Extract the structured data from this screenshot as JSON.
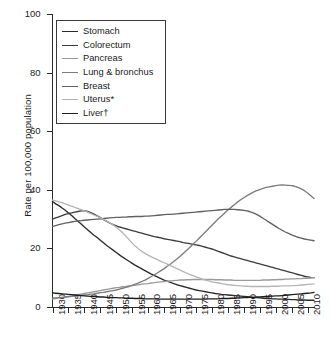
{
  "chart_data": {
    "type": "line",
    "title": "",
    "xlabel": "",
    "ylabel": "Rate per 100,000 population",
    "xlim": [
      1930,
      2012
    ],
    "ylim": [
      0,
      100
    ],
    "xticks": [
      1930,
      1935,
      1940,
      1945,
      1950,
      1955,
      1960,
      1965,
      1970,
      1975,
      1980,
      1985,
      1990,
      1995,
      2000,
      2005,
      2010
    ],
    "yticks": [
      0,
      20,
      40,
      60,
      80,
      100
    ],
    "grid": false,
    "legend_position": "top-left",
    "x_start": 1930,
    "x_step": 1,
    "series": [
      {
        "name": "Stomach",
        "color": "#2b2b2b",
        "values": [
          36.0,
          35.2,
          34.6,
          33.8,
          33.0,
          32.1,
          31.2,
          30.2,
          29.3,
          28.3,
          27.3,
          26.4,
          25.4,
          24.5,
          23.7,
          22.8,
          21.9,
          21.0,
          20.2,
          19.4,
          18.6,
          17.8,
          17.0,
          16.3,
          15.6,
          14.9,
          14.2,
          13.6,
          13.0,
          12.4,
          11.8,
          11.2,
          10.7,
          10.2,
          9.7,
          9.2,
          8.8,
          8.4,
          8.0,
          7.6,
          7.3,
          7.0,
          6.7,
          6.4,
          6.1,
          5.8,
          5.6,
          5.4,
          5.2,
          5.0,
          4.8,
          4.6,
          4.5,
          4.3,
          4.2,
          4.1,
          4.0,
          3.9,
          3.8,
          3.7,
          3.6,
          3.5,
          3.4,
          3.3,
          3.2,
          3.1,
          3.0,
          2.9,
          2.9,
          2.8,
          2.8,
          2.7,
          2.7,
          2.6,
          2.6,
          2.5,
          2.5,
          2.4,
          2.4,
          2.4,
          2.3,
          2.3,
          2.3
        ]
      },
      {
        "name": "Colorectum",
        "color": "#3c3c3c",
        "values": [
          30.0,
          30.4,
          30.8,
          31.2,
          31.6,
          31.9,
          32.1,
          32.4,
          32.6,
          32.8,
          32.9,
          32.6,
          32.2,
          31.7,
          31.1,
          30.5,
          29.8,
          29.2,
          28.6,
          28.1,
          27.7,
          27.3,
          27.0,
          26.7,
          26.4,
          26.1,
          25.8,
          25.5,
          25.2,
          24.9,
          24.6,
          24.3,
          24.0,
          23.8,
          23.6,
          23.3,
          23.1,
          22.9,
          22.7,
          22.5,
          22.3,
          22.0,
          21.8,
          21.6,
          21.4,
          21.2,
          21.0,
          20.7,
          20.4,
          20.1,
          19.8,
          19.4,
          19.0,
          18.6,
          18.2,
          17.8,
          17.4,
          17.1,
          16.8,
          16.5,
          16.2,
          15.9,
          15.6,
          15.3,
          15.0,
          14.7,
          14.4,
          14.1,
          13.8,
          13.5,
          13.2,
          12.9,
          12.6,
          12.3,
          12.0,
          11.7,
          11.4,
          11.1,
          10.8,
          10.5,
          10.3,
          10.1,
          10.0
        ]
      },
      {
        "name": "Pancreas",
        "color": "#9a9a9a",
        "values": [
          2.8,
          2.9,
          3.1,
          3.2,
          3.4,
          3.6,
          3.8,
          4.0,
          4.2,
          4.4,
          4.6,
          4.8,
          5.0,
          5.2,
          5.4,
          5.6,
          5.8,
          6.0,
          6.2,
          6.4,
          6.6,
          6.7,
          6.9,
          7.0,
          7.2,
          7.3,
          7.5,
          7.6,
          7.8,
          7.9,
          8.0,
          8.2,
          8.3,
          8.5,
          8.6,
          8.7,
          8.8,
          8.9,
          9.0,
          9.1,
          9.2,
          9.2,
          9.3,
          9.3,
          9.4,
          9.4,
          9.4,
          9.4,
          9.4,
          9.4,
          9.4,
          9.3,
          9.3,
          9.3,
          9.2,
          9.2,
          9.2,
          9.1,
          9.1,
          9.1,
          9.1,
          9.1,
          9.1,
          9.1,
          9.1,
          9.1,
          9.2,
          9.2,
          9.2,
          9.3,
          9.3,
          9.4,
          9.4,
          9.5,
          9.5,
          9.6,
          9.6,
          9.7,
          9.7,
          9.8,
          9.8,
          9.9,
          10.0
        ]
      },
      {
        "name": "Lung & bronchus",
        "color": "#7c7c7c",
        "values": [
          3.0,
          3.1,
          3.2,
          3.3,
          3.4,
          3.5,
          3.6,
          3.7,
          3.8,
          4.0,
          4.1,
          4.2,
          4.4,
          4.5,
          4.7,
          4.9,
          5.0,
          5.2,
          5.4,
          5.6,
          5.8,
          6.1,
          6.4,
          6.7,
          7.0,
          7.4,
          7.8,
          8.2,
          8.7,
          9.2,
          9.8,
          10.4,
          11.0,
          11.7,
          12.4,
          13.1,
          13.9,
          14.7,
          15.5,
          16.4,
          17.3,
          18.3,
          19.3,
          20.3,
          21.3,
          22.4,
          23.5,
          24.6,
          25.7,
          26.8,
          27.9,
          29.0,
          30.1,
          31.1,
          32.1,
          33.1,
          34.0,
          34.9,
          35.8,
          36.6,
          37.3,
          38.0,
          38.6,
          39.2,
          39.7,
          40.1,
          40.5,
          40.8,
          41.0,
          41.2,
          41.4,
          41.6,
          41.7,
          41.6,
          41.5,
          41.4,
          41.2,
          40.8,
          40.3,
          39.7,
          38.9,
          38.0,
          37.0
        ]
      },
      {
        "name": "Breast",
        "color": "#616161",
        "values": [
          27.5,
          27.8,
          28.1,
          28.4,
          28.6,
          28.8,
          29.0,
          29.2,
          29.4,
          29.5,
          29.6,
          29.7,
          29.8,
          29.9,
          30.0,
          30.1,
          30.2,
          30.3,
          30.4,
          30.5,
          30.6,
          30.6,
          30.7,
          30.7,
          30.8,
          30.8,
          30.9,
          30.9,
          30.9,
          31.0,
          31.0,
          31.1,
          31.2,
          31.3,
          31.4,
          31.5,
          31.6,
          31.6,
          31.7,
          31.8,
          31.9,
          32.0,
          32.1,
          32.2,
          32.3,
          32.4,
          32.5,
          32.6,
          32.7,
          32.8,
          32.9,
          33.0,
          33.1,
          33.2,
          33.3,
          33.3,
          33.3,
          33.3,
          33.2,
          33.1,
          33.0,
          32.8,
          32.5,
          32.1,
          31.6,
          31.0,
          30.3,
          29.6,
          28.9,
          28.2,
          27.5,
          26.8,
          26.2,
          25.6,
          25.1,
          24.6,
          24.2,
          23.8,
          23.5,
          23.2,
          23.0,
          22.8,
          22.6
        ]
      },
      {
        "name": "Uterus*",
        "color": "#b5b5b5",
        "values": [
          36.5,
          36.2,
          35.9,
          35.6,
          35.2,
          34.8,
          34.4,
          34.0,
          33.6,
          33.2,
          32.8,
          32.4,
          31.9,
          31.4,
          30.9,
          30.4,
          29.9,
          29.3,
          28.7,
          28.0,
          27.2,
          26.3,
          25.3,
          24.2,
          23.0,
          21.8,
          20.7,
          19.8,
          19.0,
          18.3,
          17.7,
          17.1,
          16.6,
          16.1,
          15.6,
          15.1,
          14.6,
          14.1,
          13.6,
          13.1,
          12.6,
          12.1,
          11.6,
          11.1,
          10.7,
          10.3,
          9.9,
          9.5,
          9.2,
          8.9,
          8.6,
          8.4,
          8.2,
          8.0,
          7.8,
          7.6,
          7.5,
          7.4,
          7.3,
          7.2,
          7.1,
          7.1,
          7.0,
          7.0,
          7.0,
          7.0,
          7.0,
          7.0,
          7.0,
          7.1,
          7.1,
          7.1,
          7.2,
          7.2,
          7.2,
          7.3,
          7.3,
          7.4,
          7.5,
          7.6,
          7.7,
          7.8,
          7.9
        ]
      },
      {
        "name": "Liver†",
        "color": "#1e1e1e",
        "values": [
          4.8,
          4.7,
          4.6,
          4.5,
          4.4,
          4.3,
          4.2,
          4.1,
          4.0,
          3.9,
          3.8,
          3.7,
          3.6,
          3.6,
          3.5,
          3.4,
          3.4,
          3.3,
          3.3,
          3.2,
          3.2,
          3.1,
          3.1,
          3.0,
          3.0,
          3.0,
          2.9,
          2.9,
          2.9,
          2.8,
          2.8,
          2.8,
          2.8,
          2.7,
          2.7,
          2.7,
          2.7,
          2.7,
          2.7,
          2.7,
          2.7,
          2.7,
          2.7,
          2.7,
          2.7,
          2.7,
          2.7,
          2.7,
          2.7,
          2.8,
          2.8,
          2.8,
          2.8,
          2.9,
          2.9,
          2.9,
          3.0,
          3.0,
          3.1,
          3.1,
          3.2,
          3.2,
          3.3,
          3.3,
          3.4,
          3.4,
          3.5,
          3.6,
          3.6,
          3.7,
          3.8,
          3.8,
          3.9,
          4.0,
          4.1,
          4.2,
          4.3,
          4.4,
          4.5,
          4.6,
          4.7,
          4.8,
          5.0
        ]
      }
    ]
  },
  "axis": {
    "ylabel": "Rate per 100,000 population",
    "yticklabels": [
      "0",
      "20",
      "40",
      "60",
      "80",
      "100"
    ],
    "xticklabels": [
      "1930",
      "1935",
      "1940",
      "1945",
      "1950",
      "1955",
      "1960",
      "1965",
      "1970",
      "1975",
      "1980",
      "1985",
      "1990",
      "1995",
      "2000",
      "2005",
      "2010"
    ]
  },
  "legend": {
    "entries": [
      {
        "label": "Stomach"
      },
      {
        "label": "Colorectum"
      },
      {
        "label": "Pancreas"
      },
      {
        "label": "Lung & bronchus"
      },
      {
        "label": "Breast"
      },
      {
        "label": "Uterus*"
      },
      {
        "label": "Liver†"
      }
    ]
  }
}
